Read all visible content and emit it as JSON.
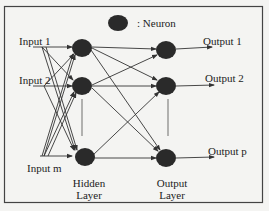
{
  "diagram": {
    "type": "neural-network",
    "legend": {
      "symbol": "filled-circle",
      "label": ": Neuron"
    },
    "inputs": [
      {
        "label": "Input 1"
      },
      {
        "label": "Input 2"
      },
      {
        "label": "Input m"
      }
    ],
    "hidden_layer": {
      "label_line1": "Hidden",
      "label_line2": "Layer",
      "neuron_count_shown": 3
    },
    "output_layer": {
      "label_line1": "Output",
      "label_line2": "Layer",
      "neuron_count_shown": 3
    },
    "outputs": [
      {
        "label": "Output 1"
      },
      {
        "label": "Output 2"
      },
      {
        "label": "Output p"
      }
    ],
    "colors": {
      "neuron": "#2a2a2a",
      "line": "#333333",
      "border": "#444444",
      "background": "#f4f4f2"
    }
  }
}
